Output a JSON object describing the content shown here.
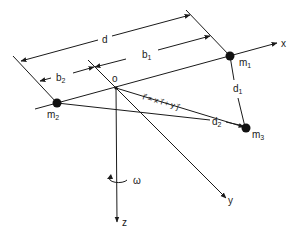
{
  "diagram": {
    "type": "three-mass rotating system geometry",
    "colors": {
      "ink": "#1a1a1a",
      "background": "#ffffff"
    },
    "origin": {
      "label": "o"
    },
    "axes": [
      {
        "name": "x",
        "label": "x"
      },
      {
        "name": "y",
        "label": "y"
      },
      {
        "name": "z",
        "label": "z"
      }
    ],
    "rotation": {
      "label": "ω",
      "icon": "rotation-arrow-icon"
    },
    "masses": [
      {
        "id": "m1",
        "label": "m",
        "sub": "1"
      },
      {
        "id": "m2",
        "label": "m",
        "sub": "2"
      },
      {
        "id": "m3",
        "label": "m",
        "sub": "3"
      }
    ],
    "dimensions": {
      "d": {
        "label": "d"
      },
      "b1": {
        "label": "b",
        "sub": "1"
      },
      "b2": {
        "label": "b",
        "sub": "2"
      },
      "d1": {
        "label": "d",
        "sub": "1"
      },
      "d2": {
        "label": "d",
        "sub": "2"
      }
    },
    "position_vector": {
      "label": "r⃗ = x i⃗ + y j⃗"
    }
  }
}
